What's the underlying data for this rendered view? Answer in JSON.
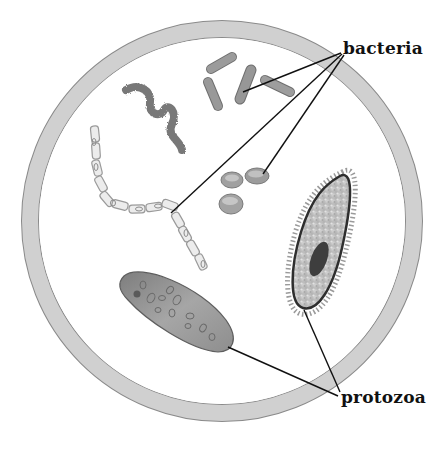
{
  "labels": {
    "bacteria": "bacteria",
    "protozoa": "protozoa"
  },
  "colors": {
    "dish_ring": "#cfcfcf",
    "dish_ring_edge": "#8a8a8a",
    "dish_inside": "#ffffff",
    "leader_line": "#111111",
    "rod_bacteria": "#8f8f8f",
    "spiral_bacteria": "#7a7a7a",
    "coccus_bacteria": "#a2a2a2",
    "chain_bacteria": "#e6e6e6",
    "protozoa_elongated": "#9a9a9a",
    "protozoa_ciliate": "#c9c9c9",
    "nucleus": "#3a3a3a"
  },
  "organisms": {
    "bacteria": [
      "spiral-bacterium",
      "rod-bacteria-group",
      "coccus-bacteria-group",
      "chain-bacteria"
    ],
    "protozoa": [
      "elongated-protozoan",
      "ciliated-protozoan"
    ]
  }
}
